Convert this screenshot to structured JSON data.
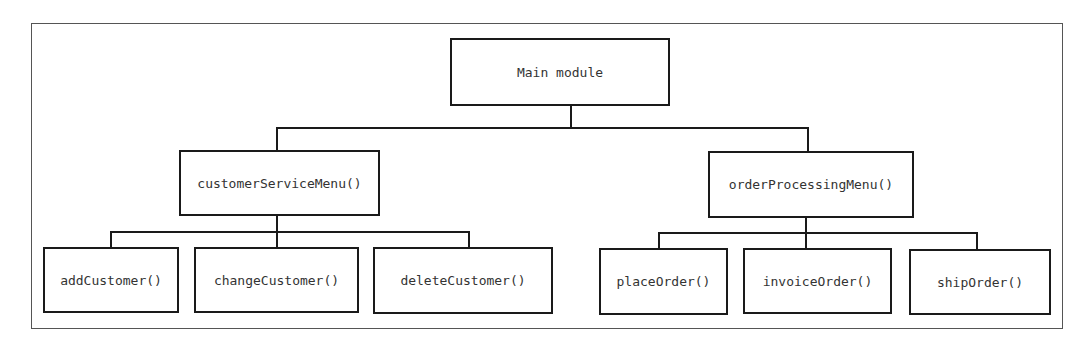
{
  "diagram": {
    "type": "hierarchy-chart",
    "root": {
      "label": "Main module"
    },
    "level1": [
      {
        "label": "customerServiceMenu()"
      },
      {
        "label": "orderProcessingMenu()"
      }
    ],
    "level2": {
      "customer": [
        {
          "label": "addCustomer()"
        },
        {
          "label": "changeCustomer()"
        },
        {
          "label": "deleteCustomer()"
        }
      ],
      "order": [
        {
          "label": "placeOrder()"
        },
        {
          "label": "invoiceOrder()"
        },
        {
          "label": "shipOrder()"
        }
      ]
    }
  }
}
